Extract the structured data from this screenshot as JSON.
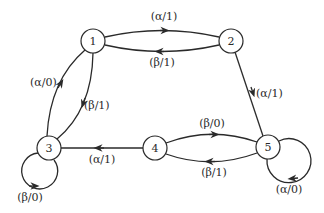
{
  "diagram": {
    "type": "state-transition-graph",
    "colors": {
      "stroke": "#2a2a2a",
      "background": "#ffffff",
      "node_fill": "#ffffff"
    },
    "nodes": [
      {
        "id": "1",
        "label": "1",
        "x": 93,
        "y": 41
      },
      {
        "id": "2",
        "label": "2",
        "x": 231,
        "y": 41
      },
      {
        "id": "3",
        "label": "3",
        "x": 49,
        "y": 148
      },
      {
        "id": "4",
        "label": "4",
        "x": 155,
        "y": 148
      },
      {
        "id": "5",
        "label": "5",
        "x": 268,
        "y": 147
      }
    ],
    "edges": [
      {
        "from": "1",
        "to": "2",
        "label": "(α/1)"
      },
      {
        "from": "2",
        "to": "1",
        "label": "(β/1)"
      },
      {
        "from": "2",
        "to": "5",
        "label": "(α/1)"
      },
      {
        "from": "3",
        "to": "1",
        "label": "(α/0)"
      },
      {
        "from": "1",
        "to": "3",
        "label": "(β/1)"
      },
      {
        "from": "4",
        "to": "3",
        "label": "(α/1)"
      },
      {
        "from": "4",
        "to": "5",
        "label": "(β/0)"
      },
      {
        "from": "5",
        "to": "4",
        "label": "(β/1)"
      },
      {
        "from": "3",
        "to": "3",
        "label": "(β/0)"
      },
      {
        "from": "5",
        "to": "5",
        "label": "(α/0)"
      }
    ]
  }
}
